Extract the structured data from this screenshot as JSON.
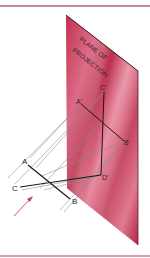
{
  "figure": {
    "plane_label_line1": "PLANE OF",
    "plane_label_line1_parts": [
      "PLANE",
      "OF"
    ],
    "plane_label_line2": "PROJECTION",
    "points": {
      "A": "A",
      "B": "B",
      "C": "C",
      "D": "D",
      "A_prime": "A'",
      "B_prime": "B'",
      "C_prime": "C'",
      "D_prime": "D'"
    },
    "viewing_arrow": "direction-of-sight-arrow"
  },
  "colors": {
    "frame_line": "#c08aa0",
    "plane_fill": "#c2344f",
    "plane_fill_light": "#e07a92",
    "plane_edge": "#3a1820",
    "object_line": "#1a1a1a",
    "projector_line": "#8a8a8a",
    "arrow": "#c0466a"
  }
}
